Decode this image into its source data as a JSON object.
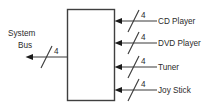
{
  "diagram": {
    "background_color": "#ffffff",
    "line_color": "#3a3a3a",
    "text_color": "#2b2b2b",
    "block": {
      "label": "",
      "x": 67,
      "y": 9,
      "width": 48,
      "height": 92
    },
    "system_bus": {
      "label_line1": "System",
      "label_line2": "Bus",
      "bus_width": "4",
      "direction": "out"
    },
    "devices": [
      {
        "label": "CD Player",
        "bus_width": "4",
        "direction": "in",
        "y": 21
      },
      {
        "label": "DVD Player",
        "bus_width": "4",
        "direction": "in",
        "y": 43
      },
      {
        "label": "Tuner",
        "bus_width": "4",
        "direction": "in",
        "y": 67
      },
      {
        "label": "Joy Stick",
        "bus_width": "4",
        "direction": "in",
        "y": 90
      }
    ]
  }
}
